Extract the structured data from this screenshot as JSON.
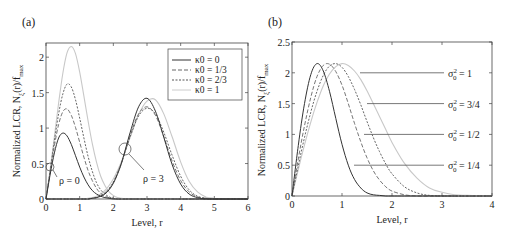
{
  "panels": [
    {
      "label": "(a)"
    },
    {
      "label": "(b)"
    }
  ],
  "chart_data": [
    {
      "type": "line",
      "panel": "(a)",
      "title": "",
      "xlabel": "Level, r",
      "ylabel": "Normalized LCR, N_ξ(r)/f_max",
      "xlim": [
        0,
        6
      ],
      "ylim": [
        0,
        2.2
      ],
      "xticks": [
        0,
        1,
        2,
        3,
        4,
        5,
        6
      ],
      "yticks": [
        0,
        0.5,
        1,
        1.5,
        2
      ],
      "xtick_labels": [
        "0",
        "1",
        "2",
        "3",
        "4",
        "5",
        "6"
      ],
      "ytick_labels": [
        "0",
        "0.5",
        "1",
        "1.5",
        "2"
      ],
      "grid": false,
      "legend_position": "upper right",
      "legend": [
        "κ0 = 0",
        "κ0 = 1/3",
        "κ0 = 2/3",
        "κ0 = 1"
      ],
      "annotations": [
        {
          "text": "ρ = 0",
          "circle": [
            0.1,
            0.45
          ]
        },
        {
          "text": "ρ = 3",
          "circle": [
            2.35,
            0.72
          ]
        }
      ],
      "x": [
        0,
        0.125,
        0.25,
        0.375,
        0.5,
        0.625,
        0.75,
        0.875,
        1.0,
        1.125,
        1.25,
        1.375,
        1.5,
        1.625,
        1.75,
        1.875,
        2.0,
        2.125,
        2.25,
        2.5,
        2.75,
        3.0,
        3.25,
        3.5,
        3.75,
        4.0,
        4.25,
        4.5,
        4.75,
        5.0,
        5.5,
        6.0
      ],
      "series": [
        {
          "name": "κ0 = 0, ρ = 0",
          "style": "solid",
          "values": [
            0,
            0.35,
            0.65,
            0.86,
            0.93,
            0.89,
            0.77,
            0.61,
            0.45,
            0.31,
            0.2,
            0.12,
            0.07,
            0.04,
            0.02,
            0.01,
            0,
            0,
            0,
            0,
            0,
            0,
            0,
            0,
            0,
            0,
            0,
            0,
            0,
            0,
            0,
            0
          ]
        },
        {
          "name": "κ0 = 1/3, ρ = 0",
          "style": "dashed",
          "values": [
            0,
            0.38,
            0.75,
            1.05,
            1.23,
            1.27,
            1.18,
            1.01,
            0.8,
            0.59,
            0.4,
            0.26,
            0.15,
            0.08,
            0.04,
            0.02,
            0.01,
            0,
            0,
            0,
            0,
            0,
            0,
            0,
            0,
            0,
            0,
            0,
            0,
            0,
            0,
            0
          ]
        },
        {
          "name": "κ0 = 2/3, ρ = 0",
          "style": "dotted",
          "values": [
            0,
            0.4,
            0.82,
            1.2,
            1.48,
            1.62,
            1.58,
            1.4,
            1.14,
            0.86,
            0.6,
            0.39,
            0.23,
            0.13,
            0.07,
            0.03,
            0.01,
            0,
            0,
            0,
            0,
            0,
            0,
            0,
            0,
            0,
            0,
            0,
            0,
            0,
            0,
            0
          ]
        },
        {
          "name": "κ0 = 1, ρ = 0",
          "style": "light",
          "values": [
            0,
            0.42,
            0.88,
            1.35,
            1.77,
            2.06,
            2.15,
            2.05,
            1.79,
            1.45,
            1.1,
            0.78,
            0.52,
            0.32,
            0.19,
            0.1,
            0.05,
            0.02,
            0.01,
            0,
            0,
            0,
            0,
            0,
            0,
            0,
            0,
            0,
            0,
            0,
            0,
            0
          ]
        },
        {
          "name": "κ0 = 0, ρ = 3",
          "style": "solid",
          "values": [
            0,
            0,
            0,
            0,
            0,
            0,
            0,
            0,
            0,
            0,
            0,
            0.01,
            0.02,
            0.04,
            0.07,
            0.13,
            0.22,
            0.35,
            0.52,
            0.94,
            1.3,
            1.42,
            1.24,
            0.87,
            0.48,
            0.21,
            0.07,
            0.02,
            0,
            0,
            0,
            0
          ]
        },
        {
          "name": "κ0 = 1/3, ρ = 3",
          "style": "dashed",
          "values": [
            0,
            0,
            0,
            0,
            0,
            0,
            0,
            0,
            0,
            0,
            0,
            0.01,
            0.02,
            0.04,
            0.08,
            0.14,
            0.23,
            0.36,
            0.52,
            0.9,
            1.2,
            1.3,
            1.18,
            0.88,
            0.53,
            0.26,
            0.1,
            0.03,
            0.01,
            0,
            0,
            0
          ]
        },
        {
          "name": "κ0 = 2/3, ρ = 3",
          "style": "dotted",
          "values": [
            0,
            0,
            0,
            0,
            0,
            0,
            0,
            0,
            0,
            0,
            0,
            0.01,
            0.02,
            0.05,
            0.09,
            0.15,
            0.24,
            0.37,
            0.52,
            0.88,
            1.17,
            1.28,
            1.2,
            0.94,
            0.61,
            0.32,
            0.13,
            0.04,
            0.01,
            0,
            0,
            0
          ]
        },
        {
          "name": "κ0 = 1, ρ = 3",
          "style": "light",
          "values": [
            0,
            0,
            0,
            0,
            0,
            0,
            0,
            0,
            0,
            0,
            0.01,
            0.02,
            0.04,
            0.07,
            0.12,
            0.19,
            0.28,
            0.4,
            0.54,
            0.87,
            1.19,
            1.38,
            1.4,
            1.2,
            0.87,
            0.52,
            0.25,
            0.1,
            0.03,
            0.01,
            0,
            0
          ]
        }
      ]
    },
    {
      "type": "line",
      "panel": "(b)",
      "title": "",
      "xlabel": "Level, r",
      "ylabel": "Normalized LCR, N_ξ(r)/f_max",
      "xlim": [
        0,
        4
      ],
      "ylim": [
        0,
        2.5
      ],
      "xticks": [
        0,
        1,
        2,
        3,
        4
      ],
      "yticks": [
        0,
        0.5,
        1,
        1.5,
        2,
        2.5
      ],
      "xtick_labels": [
        "0",
        "1",
        "2",
        "3",
        "4"
      ],
      "ytick_labels": [
        "0",
        "0.5",
        "1",
        "1.5",
        "2",
        "2.5"
      ],
      "grid": false,
      "legend_position": "none (inline labels)",
      "annotations": [
        {
          "text": "σ0² = 1",
          "y": 2.0
        },
        {
          "text": "σ0² = 3/4",
          "y": 1.5
        },
        {
          "text": "σ0² = 1/2",
          "y": 1.0
        },
        {
          "text": "σ0² = 1/4",
          "y": 0.5
        }
      ],
      "x": [
        0,
        0.125,
        0.25,
        0.375,
        0.5,
        0.625,
        0.75,
        0.875,
        1.0,
        1.125,
        1.25,
        1.375,
        1.5,
        1.625,
        1.75,
        1.875,
        2.0,
        2.25,
        2.5,
        2.75,
        3.0,
        3.25,
        3.5,
        4.0
      ],
      "series": [
        {
          "name": "σ0² = 1/4",
          "style": "solid",
          "values": [
            0,
            0.82,
            1.5,
            1.97,
            2.15,
            2.03,
            1.7,
            1.26,
            0.84,
            0.5,
            0.27,
            0.13,
            0.05,
            0.02,
            0.01,
            0,
            0,
            0,
            0,
            0,
            0,
            0,
            0,
            0
          ]
        },
        {
          "name": "σ0² = 1/2",
          "style": "dashed",
          "values": [
            0,
            0.6,
            1.14,
            1.6,
            1.94,
            2.12,
            2.14,
            2.02,
            1.8,
            1.5,
            1.18,
            0.88,
            0.62,
            0.41,
            0.26,
            0.15,
            0.08,
            0.02,
            0,
            0,
            0,
            0,
            0,
            0
          ]
        },
        {
          "name": "σ0² = 3/4",
          "style": "dotted",
          "values": [
            0,
            0.49,
            0.95,
            1.36,
            1.7,
            1.96,
            2.11,
            2.15,
            2.09,
            1.94,
            1.73,
            1.48,
            1.21,
            0.95,
            0.72,
            0.52,
            0.36,
            0.15,
            0.05,
            0.01,
            0,
            0,
            0,
            0
          ]
        },
        {
          "name": "σ0² = 1",
          "style": "light",
          "values": [
            0,
            0.43,
            0.83,
            1.2,
            1.52,
            1.79,
            1.98,
            2.1,
            2.15,
            2.12,
            2.03,
            1.89,
            1.71,
            1.5,
            1.29,
            1.08,
            0.87,
            0.53,
            0.29,
            0.13,
            0.06,
            0.02,
            0.01,
            0
          ]
        }
      ]
    }
  ]
}
